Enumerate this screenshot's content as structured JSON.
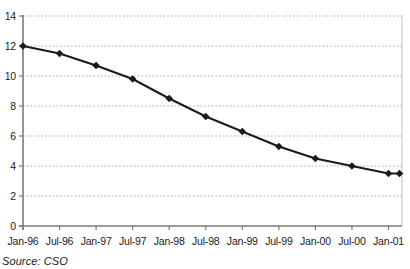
{
  "chart_data": {
    "type": "line",
    "title": "",
    "xlabel": "",
    "ylabel": "",
    "ylim": [
      0,
      14
    ],
    "y_ticks": [
      0,
      2,
      4,
      6,
      8,
      10,
      12,
      14
    ],
    "x_tick_labels": [
      "Jan-96",
      "Jul-96",
      "Jan-97",
      "Jul-97",
      "Jan-98",
      "Jul-98",
      "Jan-99",
      "Jul-99",
      "Jan-00",
      "Jul-00",
      "Jan-01"
    ],
    "grid": "horizontal dotted gridlines at each y tick, plot area bordered on right and top by light line",
    "legend": "none",
    "series": [
      {
        "name": "rate",
        "marker": "diamond",
        "points": [
          {
            "x": 0,
            "y": 12.0
          },
          {
            "x": 1,
            "y": 11.5
          },
          {
            "x": 2,
            "y": 10.7
          },
          {
            "x": 3,
            "y": 9.8
          },
          {
            "x": 4,
            "y": 8.5
          },
          {
            "x": 5,
            "y": 7.3
          },
          {
            "x": 6,
            "y": 6.3
          },
          {
            "x": 7,
            "y": 5.3
          },
          {
            "x": 8,
            "y": 4.5
          },
          {
            "x": 9,
            "y": 4.0
          },
          {
            "x": 10,
            "y": 3.5
          },
          {
            "x": 10.3,
            "y": 3.5
          }
        ]
      }
    ]
  },
  "source_note": "Source: CSO",
  "colors": {
    "line": "#1a1a1a",
    "marker": "#1a1a1a",
    "axis": "#7a7a7a",
    "gridline": "#a8a8a8",
    "plot_border": "#c9c9c9",
    "text": "#1a1a1a"
  }
}
